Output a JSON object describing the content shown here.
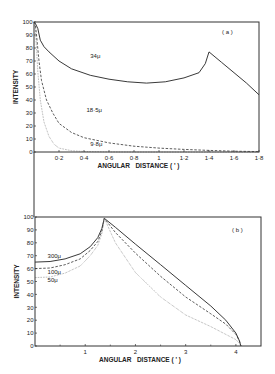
{
  "chart_data": [
    {
      "panel": "a",
      "type": "line",
      "panel_label": "( a )",
      "xlabel": "ANGULAR   DISTANCE ( ' )",
      "ylabel": "INTENSITY",
      "xlim": [
        0,
        1.8
      ],
      "ylim": [
        0,
        100
      ],
      "x_ticks": [
        0.2,
        0.4,
        0.6,
        0.8,
        1,
        1.2,
        1.4,
        1.6,
        1.8
      ],
      "x_tick_labels": [
        "0·2",
        "0·4",
        "0·6",
        "0·8",
        "1",
        "1·2",
        "1·4",
        "1·6",
        "1·8"
      ],
      "y_ticks": [
        0,
        10,
        20,
        30,
        40,
        50,
        60,
        70,
        80,
        90,
        100
      ],
      "grid": false,
      "series": [
        {
          "name": "34μ",
          "style": "solid",
          "label_pos": [
            0.45,
            72
          ],
          "x": [
            0,
            0.01,
            0.03,
            0.05,
            0.08,
            0.12,
            0.2,
            0.3,
            0.45,
            0.6,
            0.75,
            0.9,
            1.05,
            1.2,
            1.32,
            1.37,
            1.4,
            1.5,
            1.6,
            1.7,
            1.8
          ],
          "y": [
            100,
            99,
            95,
            86,
            81,
            77,
            70,
            64,
            59,
            56,
            54,
            53,
            54,
            57,
            61,
            68,
            77,
            69,
            61,
            53,
            44
          ]
        },
        {
          "name": "18·5μ",
          "style": "dashed",
          "label_pos": [
            0.42,
            31
          ],
          "x": [
            0,
            0.01,
            0.02,
            0.04,
            0.06,
            0.1,
            0.15,
            0.2,
            0.3,
            0.4,
            0.6,
            0.8,
            1.0,
            1.2,
            1.4,
            1.6,
            1.8
          ],
          "y": [
            100,
            98,
            90,
            70,
            55,
            40,
            30,
            22,
            15,
            11,
            7,
            4.5,
            3,
            2,
            1.2,
            0.6,
            0.3
          ]
        },
        {
          "name": "9·8μ",
          "style": "dotted",
          "label_pos": [
            0.45,
            5
          ],
          "x": [
            0,
            0.01,
            0.02,
            0.03,
            0.05,
            0.08,
            0.12,
            0.16,
            0.2,
            0.3,
            0.4,
            0.6,
            0.8,
            1.0,
            1.8
          ],
          "y": [
            100,
            95,
            80,
            62,
            40,
            23,
            12,
            6,
            3,
            1,
            0.4,
            0.1,
            0,
            0,
            0
          ]
        }
      ]
    },
    {
      "panel": "b",
      "type": "line",
      "panel_label": "( b )",
      "xlabel": "ANGULAR   DISTANCE ( ' )",
      "ylabel": "INTENSITY",
      "xlim": [
        0,
        4.5
      ],
      "ylim": [
        0,
        100
      ],
      "x_ticks": [
        1,
        2,
        3,
        4
      ],
      "x_tick_labels": [
        "1",
        "2",
        "3",
        "4"
      ],
      "x_minor_ticks": [
        0.5,
        1.5,
        2.5,
        3.5
      ],
      "y_ticks": [
        0,
        10,
        20,
        30,
        40,
        50,
        60,
        70,
        80,
        90,
        100
      ],
      "grid": false,
      "series": [
        {
          "name": "300μ",
          "style": "solid",
          "label_pos": [
            0.25,
            68
          ],
          "x": [
            0,
            0.3,
            0.6,
            0.9,
            1.1,
            1.25,
            1.33,
            1.38,
            1.6,
            2.0,
            2.5,
            3.0,
            3.5,
            3.8,
            4.0,
            4.07,
            4.1
          ],
          "y": [
            65,
            65.5,
            67.5,
            71.5,
            77,
            84,
            91,
            99,
            92,
            79,
            63,
            47,
            31,
            20,
            10,
            4,
            0
          ]
        },
        {
          "name": "100μ",
          "style": "dashed",
          "label_pos": [
            0.25,
            56
          ],
          "x": [
            0,
            0.3,
            0.6,
            0.9,
            1.1,
            1.25,
            1.33,
            1.38,
            1.6,
            2.0,
            2.5,
            3.0,
            3.5,
            3.8,
            4.0,
            4.07,
            4.1
          ],
          "y": [
            60,
            60.5,
            63,
            67.5,
            74,
            81,
            89,
            99,
            88,
            72,
            54,
            38,
            25,
            17,
            9,
            4,
            0
          ]
        },
        {
          "name": "50μ",
          "style": "dotted",
          "label_pos": [
            0.25,
            50
          ],
          "x": [
            0,
            0.3,
            0.6,
            0.9,
            1.1,
            1.25,
            1.33,
            1.38,
            1.6,
            2.0,
            2.5,
            3.0,
            3.5,
            3.8,
            4.0,
            4.07,
            4.1
          ],
          "y": [
            53,
            53.5,
            56.5,
            62,
            70,
            78,
            87,
            99,
            80,
            57,
            38,
            24,
            15,
            9,
            5,
            2,
            0
          ]
        }
      ]
    }
  ]
}
